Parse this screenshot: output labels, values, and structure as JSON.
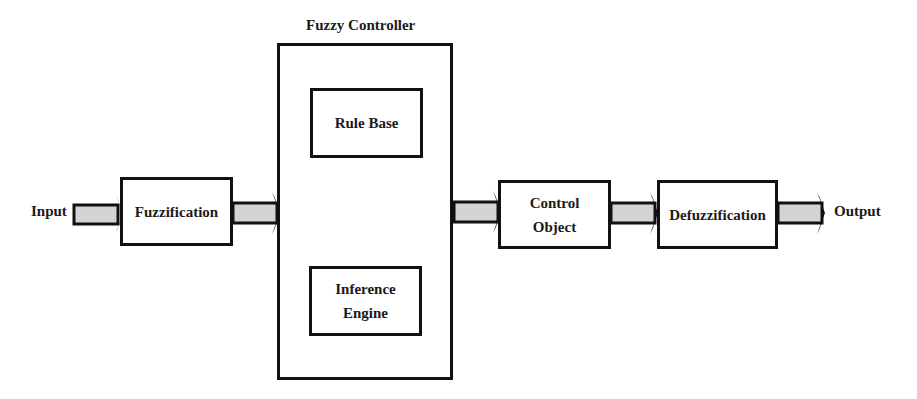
{
  "diagram": {
    "title": "Fuzzy Controller",
    "nodes": [
      {
        "id": "fuzzification",
        "label": "Fuzzification"
      },
      {
        "id": "rule_base",
        "label": "Rule Base"
      },
      {
        "id": "inference_engine",
        "label": "Inference Engine",
        "lines": [
          "Inference",
          "Engine"
        ]
      },
      {
        "id": "control_object",
        "label": "Control Object",
        "lines": [
          "Control",
          "Object"
        ]
      },
      {
        "id": "defuzzification",
        "label": "Defuzzification"
      }
    ],
    "input_label": "Input",
    "output_label": "Output",
    "edges": [
      {
        "from": "Input",
        "to": "fuzzification"
      },
      {
        "from": "fuzzification",
        "to": "Fuzzy Controller"
      },
      {
        "from": "rule_base",
        "to": "inference_engine",
        "bidirectional": true
      },
      {
        "from": "Fuzzy Controller",
        "to": "control_object"
      },
      {
        "from": "control_object",
        "to": "defuzzification"
      },
      {
        "from": "defuzzification",
        "to": "Output"
      }
    ],
    "colors": {
      "arrow_fill": "#d4d4d4",
      "stroke": "#111111"
    }
  }
}
